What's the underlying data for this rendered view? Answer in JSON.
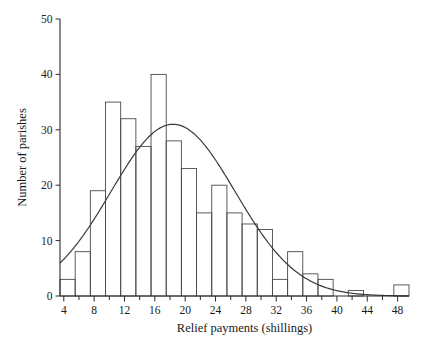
{
  "chart_data": {
    "type": "bar",
    "title": "",
    "subtitle": "",
    "xlabel": "Relief payments (shillings)",
    "ylabel": "Number of parishes",
    "xlim": [
      3.5,
      49.5
    ],
    "ylim": [
      0,
      50
    ],
    "grid": false,
    "legend": null,
    "x_ticks_major": [
      4,
      8,
      12,
      16,
      20,
      24,
      28,
      32,
      36,
      40,
      44,
      48
    ],
    "x_ticks_minor": [
      6,
      10,
      14,
      18,
      22,
      26,
      30,
      34,
      38,
      42,
      46
    ],
    "y_ticks": [
      0,
      10,
      20,
      30,
      40,
      50
    ],
    "bin_width": 2,
    "bin_start": 3.5,
    "bin_edges": [
      3.5,
      5.5,
      7.5,
      9.5,
      11.5,
      13.5,
      15.5,
      17.5,
      19.5,
      21.5,
      23.5,
      25.5,
      27.5,
      29.5,
      31.5,
      33.5,
      35.5,
      37.5,
      39.5,
      41.5,
      43.5,
      45.5,
      47.5,
      49.5
    ],
    "bin_centers": [
      4.5,
      6.5,
      8.5,
      10.5,
      12.5,
      14.5,
      16.5,
      18.5,
      20.5,
      22.5,
      24.5,
      26.5,
      28.5,
      30.5,
      32.5,
      34.5,
      36.5,
      38.5,
      40.5,
      42.5,
      44.5,
      46.5,
      48.5
    ],
    "values": [
      3,
      8,
      19,
      35,
      32,
      27,
      40,
      28,
      23,
      15,
      20,
      15,
      13,
      12,
      3,
      8,
      4,
      3,
      0,
      1,
      0,
      0,
      2
    ],
    "overlay_curve": {
      "name": "fitted normal curve",
      "type": "line",
      "mean": 18.4,
      "peak_y": 31.0,
      "sigma": 8.2,
      "amplitude_scale": 31.0,
      "x_start": 3.5,
      "x_end": 49.5
    }
  },
  "axes": {
    "y_title": "Number of parishes",
    "x_title": "Relief payments (shillings)",
    "y_tick_labels": [
      "0",
      "10",
      "20",
      "30",
      "40",
      "50"
    ],
    "x_tick_labels": [
      "4",
      "8",
      "12",
      "16",
      "20",
      "24",
      "28",
      "32",
      "36",
      "40",
      "44",
      "48"
    ]
  },
  "colors": {
    "bar_stroke": "#4a4a4a",
    "curve_stroke": "#3a3a3a",
    "axis": "#2b2b2b",
    "text": "#1a1a1a",
    "background": "#ffffff"
  }
}
